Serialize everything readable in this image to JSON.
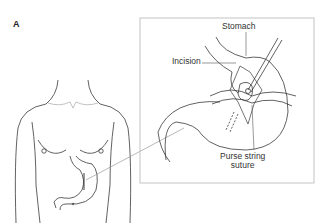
{
  "figure": {
    "panel_label": "A",
    "labels": {
      "stomach": "Stomach",
      "incision": "Incision",
      "purse_string_line1": "Purse string",
      "purse_string_line2": "suture"
    },
    "colors": {
      "line": "#3a3a3a",
      "box_border": "#bdbdbd",
      "leader": "#888888"
    }
  }
}
